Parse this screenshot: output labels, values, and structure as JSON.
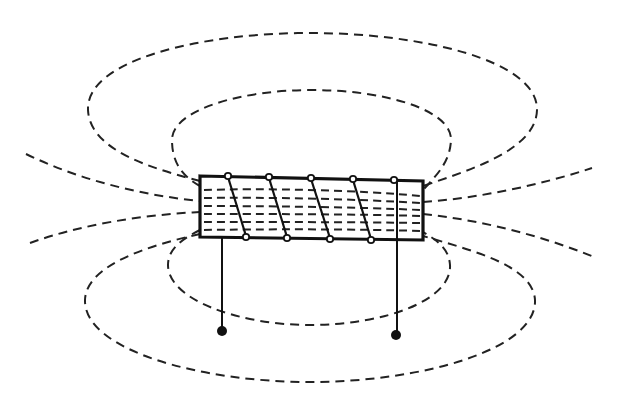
{
  "diagram": {
    "title": "",
    "colors": {
      "background": "#ffffff",
      "ink": "#111111"
    },
    "components": {
      "solenoid": {
        "turns": 5,
        "label": ""
      },
      "leads": [
        {
          "name": "left-terminal",
          "label": ""
        },
        {
          "name": "right-terminal",
          "label": ""
        }
      ],
      "field_lines": {
        "closed_loops_above": 2,
        "closed_loops_below": 2,
        "open_lines_left": 2,
        "open_lines_right": 2,
        "internal_lines": 6
      }
    }
  }
}
